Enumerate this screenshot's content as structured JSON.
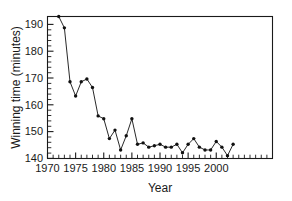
{
  "chart_data": {
    "type": "line",
    "title": "",
    "xlabel": "Year",
    "ylabel": "Winning time (minutes)",
    "xlim": [
      1970,
      2010
    ],
    "ylim": [
      140,
      190
    ],
    "grid": false,
    "legend": "none",
    "marker": "filled-circle",
    "x_major_ticks": [
      1970,
      1975,
      1980,
      1985,
      1990,
      1995,
      2000
    ],
    "x_major_tick_labels": [
      "1970",
      "1975",
      "1980",
      "1985",
      "1990",
      "1995",
      "2000"
    ],
    "x_minor_tick_step": 1,
    "y_major_ticks": [
      140,
      150,
      160,
      170,
      180,
      190
    ],
    "y_major_tick_labels": [
      "140",
      "150",
      "160",
      "170",
      "180",
      "190"
    ],
    "y_minor_tick_step": 2,
    "series": [
      {
        "name": "Winning time",
        "x": [
          1972,
          1973,
          1974,
          1975,
          1976,
          1977,
          1978,
          1979,
          1980,
          1981,
          1982,
          1983,
          1984,
          1985,
          1986,
          1987,
          1988,
          1989,
          1990,
          1991,
          1992,
          1993,
          1994,
          1995,
          1996,
          1997,
          1998,
          1999,
          2000,
          2001,
          2002,
          2003
        ],
        "values": [
          190,
          186,
          167,
          162,
          167,
          168,
          165,
          155,
          154,
          147,
          150,
          143,
          148,
          154,
          145,
          145.5,
          144,
          144.5,
          145,
          144,
          144,
          145,
          142,
          145,
          147,
          144,
          143,
          143,
          146,
          144,
          141,
          145
        ],
        "y_last_value": 144
      }
    ]
  },
  "axis": {
    "x_title": "Year",
    "y_title": "Winning time (minutes)"
  }
}
